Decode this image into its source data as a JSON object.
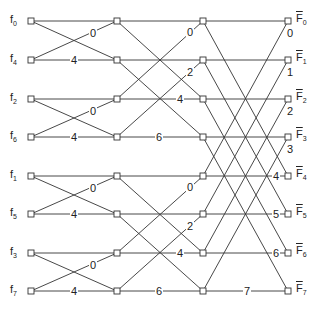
{
  "diagram": {
    "type": "FFT butterfly flow graph (decimation-in-time, N=8)",
    "columns_x": [
      31,
      117,
      203,
      288
    ],
    "rows_y": [
      21,
      60,
      99,
      137,
      176,
      214,
      253,
      291
    ],
    "inputs": [
      {
        "base": "f",
        "sub": "0"
      },
      {
        "base": "f",
        "sub": "4"
      },
      {
        "base": "f",
        "sub": "2"
      },
      {
        "base": "f",
        "sub": "6"
      },
      {
        "base": "f",
        "sub": "1"
      },
      {
        "base": "f",
        "sub": "5"
      },
      {
        "base": "f",
        "sub": "3"
      },
      {
        "base": "f",
        "sub": "7"
      }
    ],
    "outputs": [
      {
        "base": "F",
        "sub": "0"
      },
      {
        "base": "F",
        "sub": "1"
      },
      {
        "base": "F",
        "sub": "2"
      },
      {
        "base": "F",
        "sub": "3"
      },
      {
        "base": "F",
        "sub": "4"
      },
      {
        "base": "F",
        "sub": "5"
      },
      {
        "base": "F",
        "sub": "6"
      },
      {
        "base": "F",
        "sub": "7"
      }
    ],
    "stage1_labels": [
      {
        "text": "0",
        "x": 89,
        "y": 28
      },
      {
        "text": "4",
        "x": 70,
        "y": 55
      },
      {
        "text": "0",
        "x": 89,
        "y": 106
      },
      {
        "text": "4",
        "x": 70,
        "y": 132
      },
      {
        "text": "0",
        "x": 89,
        "y": 183
      },
      {
        "text": "4",
        "x": 70,
        "y": 209
      },
      {
        "text": "0",
        "x": 89,
        "y": 260
      },
      {
        "text": "4",
        "x": 70,
        "y": 286
      }
    ],
    "stage2_labels": [
      {
        "text": "0",
        "x": 186,
        "y": 27
      },
      {
        "text": "2",
        "x": 186,
        "y": 67
      },
      {
        "text": "4",
        "x": 176,
        "y": 94
      },
      {
        "text": "6",
        "x": 155,
        "y": 132
      },
      {
        "text": "0",
        "x": 186,
        "y": 182
      },
      {
        "text": "2",
        "x": 186,
        "y": 221
      },
      {
        "text": "4",
        "x": 176,
        "y": 248
      },
      {
        "text": "6",
        "x": 155,
        "y": 286
      }
    ],
    "stage3_labels": [
      {
        "text": "0",
        "x": 286,
        "y": 28
      },
      {
        "text": "1",
        "x": 286,
        "y": 67
      },
      {
        "text": "2",
        "x": 286,
        "y": 106
      },
      {
        "text": "3",
        "x": 286,
        "y": 144
      },
      {
        "text": "4",
        "x": 272,
        "y": 171
      },
      {
        "text": "5",
        "x": 272,
        "y": 209
      },
      {
        "text": "6",
        "x": 272,
        "y": 248
      },
      {
        "text": "7",
        "x": 243,
        "y": 286
      }
    ]
  }
}
